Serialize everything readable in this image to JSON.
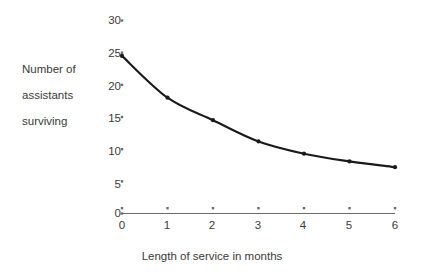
{
  "chart_data": {
    "type": "line",
    "title": "",
    "xlabel": "Length of service in months",
    "ylabel": "Number of assistants surviving",
    "ylabel_lines": [
      "Number of",
      "assistants",
      "surviving"
    ],
    "x": [
      0,
      1,
      2,
      3,
      4,
      5,
      6
    ],
    "values": [
      24.5,
      18.0,
      14.5,
      11.2,
      9.3,
      8.1,
      7.2
    ],
    "series": [
      {
        "name": "assistants surviving",
        "values": [
          24.5,
          18.0,
          14.5,
          11.2,
          9.3,
          8.1,
          7.2
        ]
      }
    ],
    "xlim": [
      0,
      6
    ],
    "ylim": [
      0,
      30
    ],
    "xticks": [
      "0",
      "1",
      "2",
      "3",
      "4",
      "5",
      "6"
    ],
    "yticks": [
      "0",
      "5",
      "10",
      "15",
      "20",
      "25",
      "30"
    ],
    "ytick_values": [
      0,
      5,
      10,
      15,
      20,
      25,
      30
    ],
    "grid": false,
    "legend": "none",
    "marker": "dot",
    "line_color": "#1a1a1a",
    "axis_color": "#6b6b6b",
    "text_color": "#3a3a3a"
  }
}
